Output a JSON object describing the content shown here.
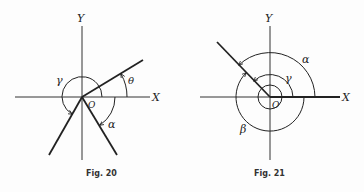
{
  "figures": [
    {
      "id": "fig20",
      "caption": "Fig. 20",
      "axes": {
        "x_label": "X",
        "y_label": "Y",
        "origin_label": "O"
      },
      "angles": [
        {
          "name": "theta",
          "label": "θ",
          "direction": "counterclockwise",
          "description": "positive angle from X axis to terminal side in first quadrant"
        },
        {
          "name": "gamma",
          "label": "γ",
          "direction": "counterclockwise",
          "description": "positive angle greater than 180° ending in third quadrant"
        },
        {
          "name": "alpha",
          "label": "α",
          "direction": "clockwise",
          "description": "negative angle ending in fourth quadrant"
        }
      ]
    },
    {
      "id": "fig21",
      "caption": "Fig. 21",
      "axes": {
        "x_label": "X",
        "y_label": "Y",
        "origin_label": "O"
      },
      "angles": [
        {
          "name": "alpha",
          "label": "α",
          "direction": "counterclockwise",
          "description": "angle to terminal side in second quadrant"
        },
        {
          "name": "gamma",
          "label": "γ",
          "direction": "counterclockwise",
          "description": "coterminal angle with more than one revolution"
        },
        {
          "name": "beta",
          "label": "β",
          "direction": "clockwise",
          "description": "negative coterminal angle"
        }
      ]
    }
  ]
}
